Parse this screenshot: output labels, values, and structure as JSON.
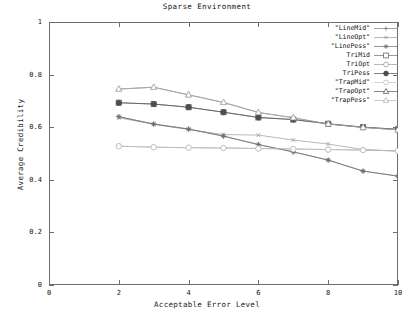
{
  "chart_data": {
    "type": "line",
    "title": "Sparse Environment",
    "xlabel": "Acceptable Error Level",
    "ylabel": "Average Credibility",
    "xlim": [
      0,
      10
    ],
    "ylim": [
      0,
      1
    ],
    "xticks": [
      "0",
      "2",
      "4",
      "6",
      "8",
      "10"
    ],
    "yticks": [
      "0",
      "0.2",
      "0.4",
      "0.6",
      "0.8",
      "1"
    ],
    "grid": false,
    "legend_position": "top-right-inside",
    "x": [
      2,
      3,
      4,
      5,
      6,
      7,
      8,
      9,
      10
    ],
    "series": [
      {
        "name": "\"LineMid\"",
        "marker": "plus",
        "color": "#7b7b7b",
        "values": [
          0.64,
          0.612,
          0.593,
          0.566,
          0.534,
          0.506,
          0.475,
          0.433,
          0.414
        ]
      },
      {
        "name": "\"LineOpt\"",
        "marker": "cross",
        "color": "#9a9a9a",
        "values": [
          0.636,
          0.611,
          0.591,
          0.572,
          0.57,
          0.551,
          0.536,
          0.515,
          0.509
        ]
      },
      {
        "name": "\"LinePess\"",
        "marker": "star",
        "color": "#6a6a6a",
        "values": [
          0.64,
          0.612,
          0.593,
          0.566,
          0.534,
          0.506,
          0.475,
          0.433,
          0.414
        ]
      },
      {
        "name": "TriMid",
        "marker": "open-square",
        "color": "#6a6a6a",
        "values": [
          0.693,
          0.688,
          0.676,
          0.657,
          0.637,
          0.629,
          0.613,
          0.6,
          0.592
        ]
      },
      {
        "name": "TriOpt",
        "marker": "open-circle",
        "color": "#9a9a9a",
        "values": [
          0.528,
          0.524,
          0.522,
          0.521,
          0.519,
          0.517,
          0.515,
          0.513,
          0.51
        ]
      },
      {
        "name": "TriPess",
        "marker": "filled-circle",
        "color": "#4d4d4d",
        "values": [
          0.693,
          0.688,
          0.676,
          0.657,
          0.637,
          0.629,
          0.613,
          0.6,
          0.592
        ]
      },
      {
        "name": "\"TrapMid\"",
        "marker": "light-circle",
        "color": "#c0c0c0",
        "values": [
          0.528,
          0.524,
          0.522,
          0.521,
          0.519,
          0.517,
          0.515,
          0.513,
          0.51
        ]
      },
      {
        "name": "\"TrapOpt\"",
        "marker": "open-triangle",
        "color": "#5a5a5a",
        "values": [
          0.745,
          0.752,
          0.723,
          0.694,
          0.656,
          0.636,
          0.612,
          0.599,
          0.59
        ]
      },
      {
        "name": "\"TrapPess\"",
        "marker": "light-triangle",
        "color": "#b5b5b5",
        "values": [
          0.745,
          0.752,
          0.723,
          0.694,
          0.656,
          0.636,
          0.612,
          0.599,
          0.59
        ]
      }
    ]
  }
}
